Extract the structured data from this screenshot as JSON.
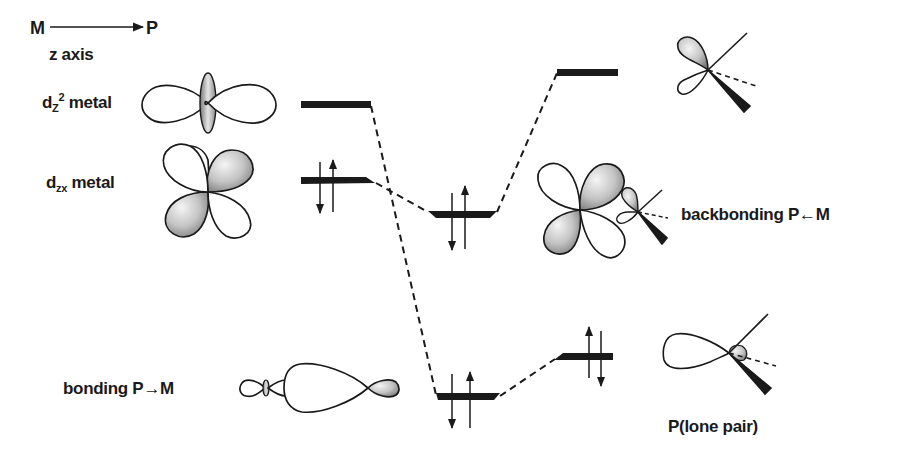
{
  "diagram": {
    "type": "molecular-orbital-energy-diagram",
    "axis": {
      "from": "M",
      "to": "P",
      "label": "z axis"
    },
    "labels": {
      "dz2_base": "d",
      "dz2_sub": "Z",
      "dz2_sup": "2",
      "dz2_tail": " metal",
      "dzx_base": "d",
      "dzx_sub": "zx",
      "dzx_tail": " metal",
      "bonding": "bonding P→M",
      "backbonding": "backbonding P←M",
      "lone_pair": "P(lone pair)"
    },
    "levels": [
      {
        "id": "dz2-metal",
        "column": "left",
        "electrons": 0
      },
      {
        "id": "dzx-metal",
        "column": "left",
        "electrons": 2
      },
      {
        "id": "backbonding-mo",
        "column": "center",
        "electrons": 2
      },
      {
        "id": "bonding-mo",
        "column": "center",
        "electrons": 2
      },
      {
        "id": "p-acceptor",
        "column": "right",
        "electrons": 0
      },
      {
        "id": "p-lone-pair",
        "column": "right",
        "electrons": 2
      }
    ],
    "correlations": [
      {
        "from": "dz2-metal",
        "to": "bonding-mo"
      },
      {
        "from": "dzx-metal",
        "to": "backbonding-mo"
      },
      {
        "from": "backbonding-mo",
        "to": "p-acceptor"
      },
      {
        "from": "bonding-mo",
        "to": "p-lone-pair"
      }
    ],
    "colors": {
      "ink": "#1a1a1a",
      "shade_light": "#f2f2f2",
      "shade_dark": "#8a8a8a"
    }
  }
}
